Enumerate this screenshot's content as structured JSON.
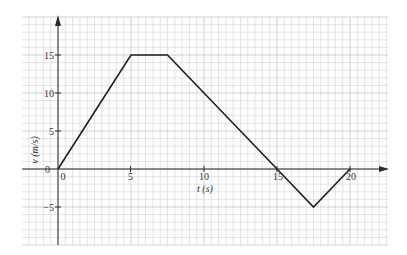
{
  "chart_data": {
    "type": "line",
    "title": "",
    "xlabel": "t (s)",
    "ylabel": "v (m/s)",
    "x": [
      0,
      5,
      7.5,
      15,
      17.5,
      20
    ],
    "y": [
      0,
      15,
      15,
      0,
      -5,
      0
    ],
    "series": [
      {
        "name": "velocity",
        "x": [
          0,
          5,
          7.5,
          15,
          17.5,
          20
        ],
        "values": [
          0,
          15,
          15,
          0,
          -5,
          0
        ]
      }
    ],
    "xticks": [
      "0",
      "5",
      "10",
      "15",
      "20"
    ],
    "yticks": [
      "−5",
      "0",
      "5",
      "10",
      "15"
    ],
    "xlim": [
      -2.5,
      22.5
    ],
    "ylim": [
      -10,
      20
    ],
    "grid": true,
    "legend": "none"
  },
  "colors": {
    "grid_minor": "#d9d9d9",
    "grid_major": "#bdbdbd",
    "axis": "#2a2a2a",
    "line": "#1e1e1e"
  },
  "labels": {
    "x_axis_title": "t (s)",
    "y_axis_title": "v (m/s)",
    "origin_y": "0",
    "x0": "0",
    "x5": "5",
    "x10": "10",
    "x15": "15",
    "x20": "20",
    "y_neg5": "−5",
    "y5": "5",
    "y10": "10",
    "y15": "15"
  }
}
